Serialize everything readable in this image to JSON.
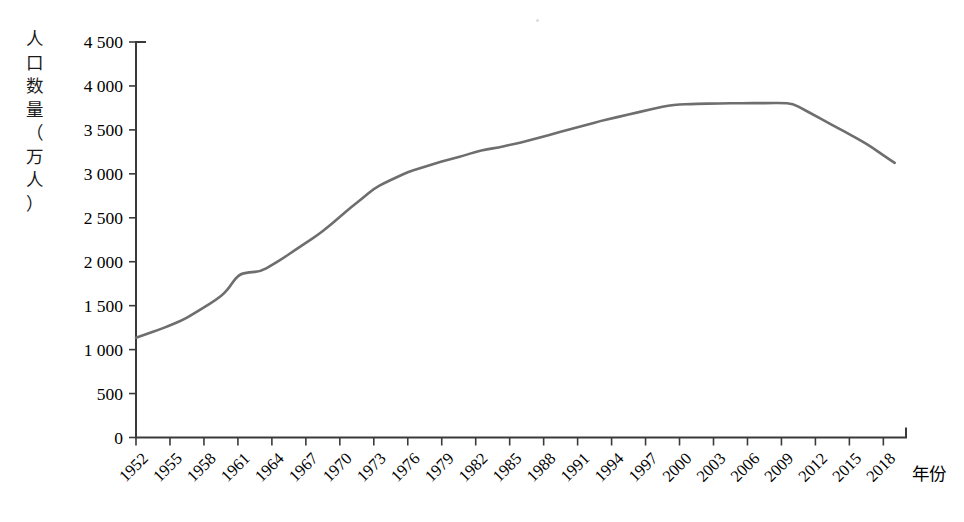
{
  "chart_data": {
    "type": "line",
    "title": "",
    "subtitle": "",
    "xlabel": "年份",
    "ylabel": "人口数量（万人）",
    "ylabel_chars": [
      "人",
      "口",
      "数",
      "量",
      "（",
      "万",
      "人",
      "）"
    ],
    "grid": false,
    "legend": null,
    "legend_position": "none",
    "xlim": [
      1952,
      2019
    ],
    "ylim": [
      0,
      4500
    ],
    "ytick_labels": [
      "0",
      "500",
      "1 000",
      "1 500",
      "2 000",
      "2 500",
      "3 000",
      "3 500",
      "4 000",
      "4 500"
    ],
    "ytick_values": [
      0,
      500,
      1000,
      1500,
      2000,
      2500,
      3000,
      3500,
      4000,
      4500
    ],
    "xtick_labels": [
      "1952",
      "1955",
      "1958",
      "1961",
      "1964",
      "1967",
      "1970",
      "1973",
      "1976",
      "1979",
      "1982",
      "1985",
      "1988",
      "1991",
      "1994",
      "1997",
      "2000",
      "2003",
      "2006",
      "2009",
      "2012",
      "2015",
      "2018"
    ],
    "xtick_values": [
      1952,
      1955,
      1958,
      1961,
      1964,
      1967,
      1970,
      1973,
      1976,
      1979,
      1982,
      1985,
      1988,
      1991,
      1994,
      1997,
      2000,
      2003,
      2006,
      2009,
      2012,
      2015,
      2018
    ],
    "xtick_rotation": 45,
    "series": [
      {
        "name": "人口数量",
        "color": "#6e6e6e",
        "line_width": 2.6,
        "x": [
          1952,
          1953,
          1954,
          1955,
          1956,
          1957,
          1958,
          1959,
          1960,
          1961,
          1962,
          1963,
          1964,
          1965,
          1966,
          1967,
          1968,
          1969,
          1970,
          1971,
          1972,
          1973,
          1974,
          1975,
          1976,
          1977,
          1978,
          1979,
          1980,
          1981,
          1982,
          1983,
          1984,
          1985,
          1986,
          1987,
          1988,
          1989,
          1990,
          1991,
          1992,
          1993,
          1994,
          1995,
          1996,
          1997,
          1998,
          1999,
          2000,
          2001,
          2002,
          2003,
          2004,
          2005,
          2006,
          2007,
          2008,
          2009,
          2010,
          2011,
          2012,
          2013,
          2014,
          2015,
          2016,
          2017,
          2018,
          2019
        ],
        "values": [
          1135,
          1180,
          1225,
          1275,
          1330,
          1400,
          1480,
          1560,
          1660,
          1855,
          1880,
          1890,
          1960,
          2040,
          2130,
          2215,
          2300,
          2400,
          2510,
          2620,
          2720,
          2830,
          2900,
          2960,
          3020,
          3060,
          3100,
          3140,
          3175,
          3210,
          3250,
          3280,
          3300,
          3330,
          3355,
          3390,
          3425,
          3460,
          3495,
          3530,
          3565,
          3600,
          3630,
          3660,
          3690,
          3720,
          3750,
          3775,
          3790,
          3795,
          3798,
          3800,
          3802,
          3803,
          3804,
          3805,
          3805,
          3806,
          3800,
          3730,
          3660,
          3590,
          3520,
          3450,
          3380,
          3300,
          3210,
          3125
        ]
      }
    ],
    "annotations": [],
    "axis_color": "#3a3a3a",
    "background": "#ffffff"
  },
  "ui": {
    "y_axis_name": "y-axis",
    "x_axis_name": "x-axis"
  }
}
